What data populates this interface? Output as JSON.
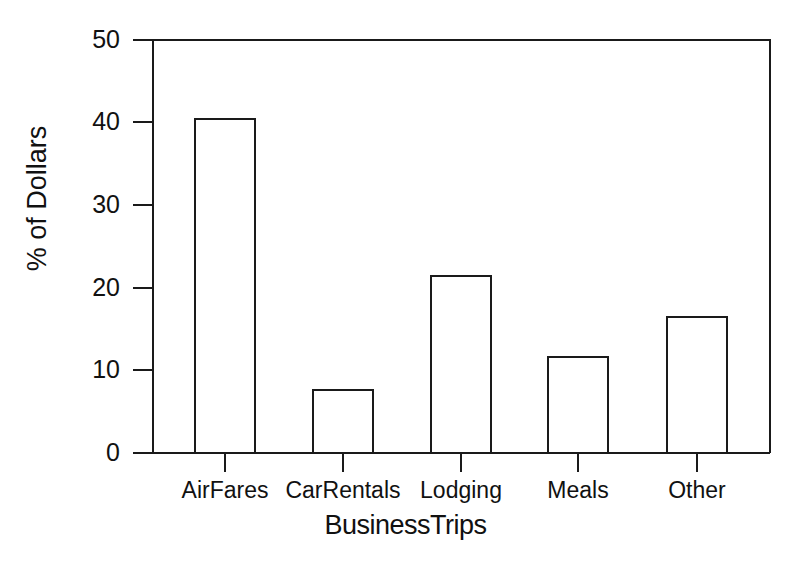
{
  "chart_data": {
    "type": "bar",
    "title": "",
    "subtitle": "",
    "categories": [
      "AirFares",
      "CarRentals",
      "Lodging",
      "Meals",
      "Other"
    ],
    "values": [
      40.4,
      7.6,
      21.4,
      11.6,
      16.5
    ],
    "xlabel": "BusinessTrips",
    "ylabel": "% of Dollars",
    "ylim": [
      0,
      50
    ],
    "yticks": [
      0,
      10,
      20,
      30,
      40,
      50
    ],
    "ytick_labels": [
      "0",
      "10",
      "20",
      "30",
      "40",
      "50"
    ],
    "grid": false,
    "legend": null,
    "bar_style": {
      "fill": "#ffffff",
      "edge": "#1a1a1a"
    },
    "annotations": []
  },
  "axes": {
    "y_title": "% of Dollars",
    "x_title": "BusinessTrips"
  },
  "colors": {
    "background": "#ffffff",
    "ink": "#1a1a1a",
    "bar_fill": "#ffffff"
  }
}
